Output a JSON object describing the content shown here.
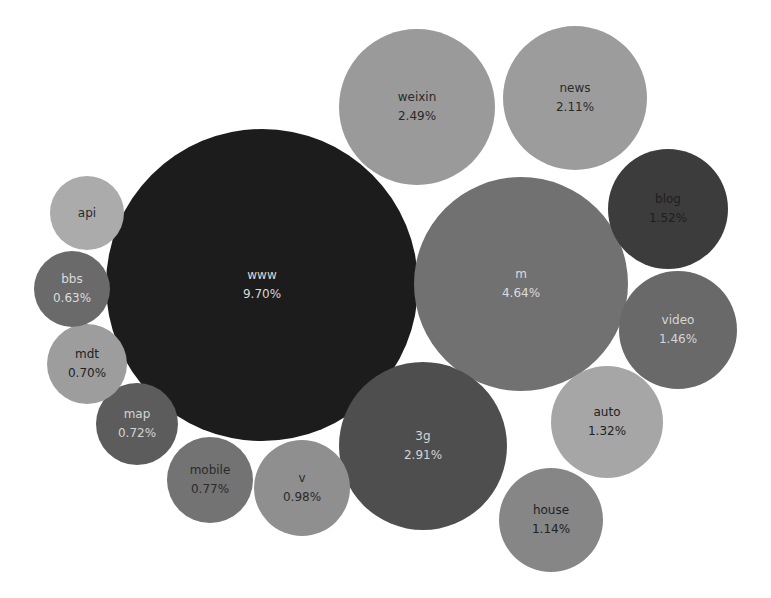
{
  "chart_data": {
    "type": "bubble",
    "title": "",
    "value_format": "percent",
    "bubbles": [
      {
        "label": "www",
        "value": 9.7,
        "display": "9.70%",
        "cx": 262,
        "cy": 285,
        "r": 156,
        "color": "#1c1c1c",
        "text_color": "#d8d8d8"
      },
      {
        "label": "m",
        "value": 4.64,
        "display": "4.64%",
        "cx": 521,
        "cy": 284,
        "r": 107,
        "color": "#717171",
        "text_color": "#dcdcdc"
      },
      {
        "label": "3g",
        "value": 2.91,
        "display": "2.91%",
        "cx": 423,
        "cy": 446,
        "r": 84,
        "color": "#4e4e4e",
        "text_color": "#d4d4d4"
      },
      {
        "label": "weixin",
        "value": 2.49,
        "display": "2.49%",
        "cx": 417,
        "cy": 107,
        "r": 78,
        "color": "#9a9a9a",
        "text_color": "#2a2a2a"
      },
      {
        "label": "news",
        "value": 2.11,
        "display": "2.11%",
        "cx": 575,
        "cy": 98,
        "r": 72,
        "color": "#9c9c9c",
        "text_color": "#2a2a2a"
      },
      {
        "label": "blog",
        "value": 1.52,
        "display": "1.52%",
        "cx": 668,
        "cy": 209,
        "r": 60,
        "color": "#3c3c3c",
        "text_color": "#1e1e1e"
      },
      {
        "label": "video",
        "value": 1.46,
        "display": "1.46%",
        "cx": 678,
        "cy": 330,
        "r": 59,
        "color": "#696969",
        "text_color": "#d6d6d6"
      },
      {
        "label": "auto",
        "value": 1.32,
        "display": "1.32%",
        "cx": 607,
        "cy": 422,
        "r": 56,
        "color": "#a6a6a6",
        "text_color": "#222222"
      },
      {
        "label": "house",
        "value": 1.14,
        "display": "1.14%",
        "cx": 551,
        "cy": 520,
        "r": 52,
        "color": "#868686",
        "text_color": "#222222"
      },
      {
        "label": "v",
        "value": 0.98,
        "display": "0.98%",
        "cx": 302,
        "cy": 488,
        "r": 48,
        "color": "#8f8f8f",
        "text_color": "#2a2a2a"
      },
      {
        "label": "mobile",
        "value": 0.77,
        "display": "0.77%",
        "cx": 210,
        "cy": 480,
        "r": 43,
        "color": "#737373",
        "text_color": "#2a2a2a"
      },
      {
        "label": "map",
        "value": 0.72,
        "display": "0.72%",
        "cx": 137,
        "cy": 424,
        "r": 41,
        "color": "#5c5c5c",
        "text_color": "#d4d4d4"
      },
      {
        "label": "mdt",
        "value": 0.7,
        "display": "0.70%",
        "cx": 87,
        "cy": 364,
        "r": 40,
        "color": "#9d9d9d",
        "text_color": "#222222"
      },
      {
        "label": "bbs",
        "value": 0.63,
        "display": "0.63%",
        "cx": 72,
        "cy": 289,
        "r": 38,
        "color": "#6a6a6a",
        "text_color": "#dcdcdc"
      },
      {
        "label": "api",
        "value": null,
        "display": "",
        "cx": 87,
        "cy": 213,
        "r": 37,
        "color": "#ababab",
        "text_color": "#2a2a2a"
      }
    ]
  }
}
